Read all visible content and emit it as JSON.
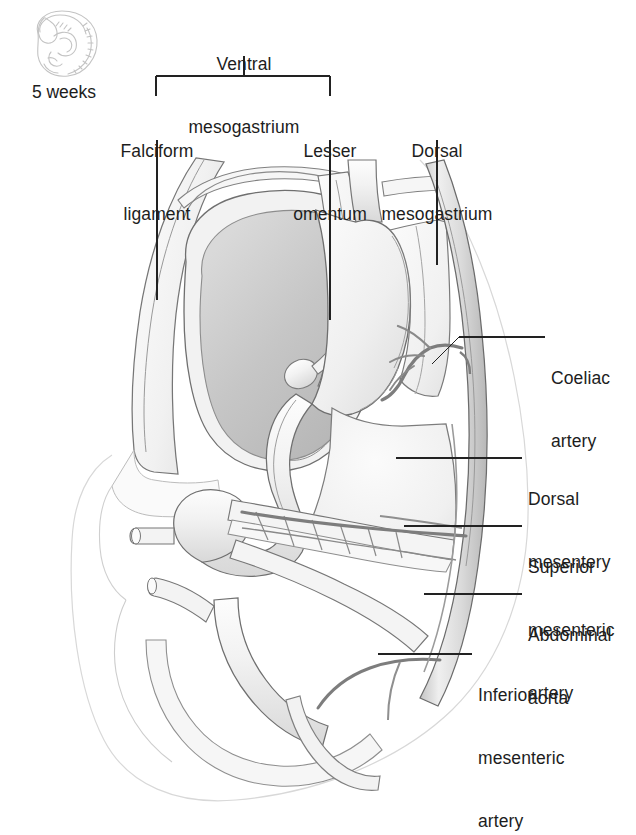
{
  "figure": {
    "domain": "anatomical-diagram",
    "stage_caption": "5 weeks",
    "embryo_icon": "curled-embryo-icon"
  },
  "bracket": {
    "title": "Ventral\nmesogastrium",
    "title_line1": "Ventral",
    "title_line2": "mesogastrium",
    "left_x": 156,
    "right_x": 330,
    "top_y": 76,
    "stem_x": 244
  },
  "top_labels": [
    {
      "id": "falciform-ligament",
      "line1": "Falciform",
      "line2": "ligament",
      "text": "Falciform ligament",
      "center_x": 157,
      "text_top": 99,
      "leader": {
        "x": 157,
        "y1": 140,
        "y2": 300
      }
    },
    {
      "id": "lesser-omentum",
      "line1": "Lesser",
      "line2": "omentum",
      "text": "Lesser omentum",
      "center_x": 330,
      "text_top": 99,
      "leader": {
        "x": 330,
        "y1": 140,
        "y2": 320
      }
    },
    {
      "id": "dorsal-mesogastrium",
      "line1": "Dorsal",
      "line2": "mesogastrium",
      "text": "Dorsal mesogastrium",
      "center_x": 437,
      "text_top": 99,
      "leader": {
        "x": 437,
        "y1": 140,
        "y2": 265
      }
    }
  ],
  "right_labels": [
    {
      "id": "coeliac-artery",
      "line1": "Coeliac",
      "line2": "artery",
      "text": "Coeliac artery",
      "text_left": 551,
      "text_top": 326,
      "leader": {
        "x1": 545,
        "y1": 337,
        "x2": 459,
        "y2": 337,
        "x3": 432,
        "y3": 364
      }
    },
    {
      "id": "dorsal-mesentery",
      "line1": "Dorsal",
      "line2": "mesentery",
      "text": "Dorsal mesentery",
      "text_left": 528,
      "text_top": 447,
      "leader": {
        "x1": 522,
        "y1": 458,
        "x2": 396,
        "y2": 458
      }
    },
    {
      "id": "superior-mesenteric-artery",
      "line1": "Superior",
      "line2": "mesenteric",
      "line3": "artery",
      "text": "Superior mesenteric artery",
      "text_left": 528,
      "text_top": 515,
      "leader": {
        "x1": 522,
        "y1": 526,
        "x2": 404,
        "y2": 526
      }
    },
    {
      "id": "abdominal-aorta",
      "line1": "Abdominal",
      "line2": "aorta",
      "text": "Abdominal aorta",
      "text_left": 528,
      "text_top": 583,
      "leader": {
        "x1": 522,
        "y1": 594,
        "x2": 424,
        "y2": 594
      }
    },
    {
      "id": "inferior-mesenteric-artery",
      "line1": "Inferior",
      "line2": "mesenteric",
      "line3": "artery",
      "text": "Inferior mesenteric artery",
      "text_left": 478,
      "text_top": 643,
      "leader": {
        "x1": 472,
        "y1": 654,
        "x2": 378,
        "y2": 654
      }
    }
  ],
  "structures": [
    {
      "id": "liver",
      "label": "Liver",
      "fill": "#c9c9c9"
    },
    {
      "id": "stomach",
      "label": "Stomach",
      "fill": "#f2f2f2"
    },
    {
      "id": "body-wall",
      "label": "Body wall",
      "fill": "#f4f4f4"
    },
    {
      "id": "amnion",
      "label": "Amniotic outline",
      "fill": "none"
    },
    {
      "id": "midgut-loop",
      "label": "Midgut loop",
      "fill": "#f3f3f3"
    },
    {
      "id": "dorsal-mesentery-sheet",
      "label": "Dorsal mesentery",
      "fill": "#f0f0f0"
    },
    {
      "id": "aorta-vessel",
      "label": "Abdominal aorta",
      "fill": "#d6d6d6"
    },
    {
      "id": "vitelline-duct",
      "label": "Vitelline duct",
      "fill": "#ededed"
    },
    {
      "id": "umbilical-vessel",
      "label": "Umbilical vessel",
      "fill": "#ededed"
    },
    {
      "id": "hindgut",
      "label": "Hindgut",
      "fill": "#f1f1f1"
    }
  ],
  "colors": {
    "line": "#5d5d5d",
    "line_soft": "#9a9a9a",
    "line_faint": "#cfcfcf",
    "leader": "#222222",
    "liver_fill": "#c9c9c9",
    "organ_fill": "#f3f3f3",
    "background": "#ffffff",
    "text": "#1d1d1d"
  }
}
